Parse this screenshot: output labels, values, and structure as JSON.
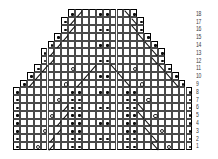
{
  "colors": {
    "background": "#ffffff",
    "grid_line": "#4a4a4a",
    "outline": "#000000",
    "symbol": "#111111",
    "row_number": "#3d3d3d"
  },
  "chart_data": {
    "type": "heatmap",
    "chart_kind": "knitting-lace-chart",
    "rows": 18,
    "cols": 26,
    "row_numbers_top_to_bottom": [
      "18",
      "17",
      "16",
      "15",
      "14",
      "13",
      "12",
      "11",
      "10",
      "9",
      "8",
      "7",
      "6",
      "5",
      "4",
      "3",
      "2",
      "1"
    ],
    "symbols_legend": {
      "dot": "purl-dot-symbol",
      "yo": "yarn-over-circle-symbol",
      "slash": "right-leaning-diagonal-symbol",
      "bslash": "left-leaning-diagonal-symbol"
    },
    "grid_rows": [
      {
        "row": 18,
        "start": 9,
        "end": 18,
        "cells": {
          "9": "dot",
          "10": "slash",
          "13": "dot",
          "14": "dot",
          "17": "bslash",
          "18": "dot"
        }
      },
      {
        "row": 17,
        "start": 8,
        "end": 19,
        "cells": {
          "8": "dot",
          "9": "slash",
          "18": "bslash",
          "19": "dot"
        }
      },
      {
        "row": 16,
        "start": 8,
        "end": 19,
        "cells": {
          "8": "dot",
          "9": "slash",
          "13": "dot",
          "14": "dot",
          "18": "bslash",
          "19": "dot"
        }
      },
      {
        "row": 15,
        "start": 7,
        "end": 20,
        "cells": {
          "7": "dot",
          "8": "slash",
          "19": "bslash",
          "20": "dot"
        }
      },
      {
        "row": 14,
        "start": 6,
        "end": 21,
        "cells": {
          "6": "dot",
          "7": "slash",
          "13": "dot",
          "14": "dot",
          "20": "bslash",
          "21": "dot"
        }
      },
      {
        "row": 13,
        "start": 5,
        "end": 22,
        "cells": {
          "5": "dot",
          "6": "slash",
          "21": "bslash",
          "22": "dot"
        }
      },
      {
        "row": 12,
        "start": 5,
        "end": 22,
        "cells": {
          "5": "dot",
          "6": "slash",
          "13": "dot",
          "14": "dot",
          "21": "bslash",
          "22": "dot"
        }
      },
      {
        "row": 11,
        "start": 4,
        "end": 23,
        "cells": {
          "4": "dot",
          "5": "slash",
          "9": "yo",
          "12": "slash",
          "15": "bslash",
          "18": "yo",
          "22": "bslash",
          "23": "dot"
        }
      },
      {
        "row": 10,
        "start": 3,
        "end": 24,
        "cells": {
          "3": "dot",
          "4": "slash",
          "11": "slash",
          "13": "dot",
          "14": "dot",
          "16": "bslash",
          "23": "bslash",
          "24": "dot"
        }
      },
      {
        "row": 9,
        "start": 2,
        "end": 25,
        "cells": {
          "2": "dot",
          "3": "slash",
          "8": "yo",
          "10": "slash",
          "17": "bslash",
          "19": "yo",
          "24": "bslash",
          "25": "dot"
        }
      },
      {
        "row": 8,
        "start": 1,
        "end": 26,
        "cells": {
          "1": "dot",
          "9": "dot",
          "10": "dot",
          "13": "dot",
          "14": "dot",
          "17": "dot",
          "18": "dot",
          "26": "dot"
        }
      },
      {
        "row": 7,
        "start": 1,
        "end": 26,
        "cells": {
          "1": "dot",
          "7": "yo",
          "9": "dot",
          "10": "dot",
          "17": "dot",
          "18": "dot",
          "20": "yo",
          "26": "dot"
        }
      },
      {
        "row": 6,
        "start": 1,
        "end": 26,
        "cells": {
          "1": "dot",
          "8": "slash",
          "9": "dot",
          "10": "dot",
          "13": "dot",
          "14": "dot",
          "17": "dot",
          "18": "dot",
          "19": "bslash",
          "26": "dot"
        }
      },
      {
        "row": 5,
        "start": 1,
        "end": 26,
        "cells": {
          "1": "dot",
          "6": "yo",
          "8": "slash",
          "9": "dot",
          "10": "dot",
          "17": "dot",
          "18": "dot",
          "19": "bslash",
          "21": "yo",
          "26": "dot"
        }
      },
      {
        "row": 4,
        "start": 1,
        "end": 26,
        "cells": {
          "1": "dot",
          "7": "slash",
          "9": "dot",
          "10": "dot",
          "13": "dot",
          "14": "dot",
          "17": "dot",
          "18": "dot",
          "20": "bslash",
          "26": "dot"
        }
      },
      {
        "row": 3,
        "start": 1,
        "end": 26,
        "cells": {
          "1": "dot",
          "5": "yo",
          "7": "slash",
          "9": "dot",
          "10": "dot",
          "17": "dot",
          "18": "dot",
          "20": "bslash",
          "22": "yo",
          "26": "dot"
        }
      },
      {
        "row": 2,
        "start": 1,
        "end": 26,
        "cells": {
          "1": "dot",
          "6": "slash",
          "9": "dot",
          "10": "dot",
          "13": "dot",
          "14": "dot",
          "17": "dot",
          "18": "dot",
          "21": "bslash",
          "26": "dot"
        }
      },
      {
        "row": 1,
        "start": 1,
        "end": 26,
        "cells": {
          "1": "dot",
          "4": "yo",
          "6": "slash",
          "9": "dot",
          "10": "dot",
          "17": "dot",
          "18": "dot",
          "21": "bslash",
          "23": "yo",
          "26": "dot"
        }
      }
    ],
    "layout": {
      "x0": 13,
      "y0": 9.4,
      "cell_w": 6.9,
      "cell_h": 7.8,
      "numbers_x": 196
    }
  }
}
